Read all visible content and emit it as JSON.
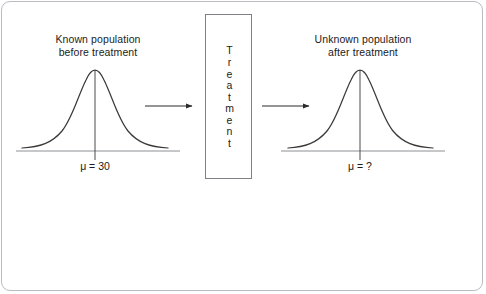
{
  "figure": {
    "kind": "statistics-hypothesis-test-diagram",
    "frame_border_color": "#b9bcc0",
    "background_color": "#ffffff",
    "ink_color": "#1b1b1b",
    "curve_color": "#3a3a3a",
    "axis_color": "#8c8f93"
  },
  "left_panel": {
    "title": "Known population\nbefore treatment",
    "mu_label": "μ = 30",
    "curve": {
      "distribution": "normal",
      "center_x": 95,
      "baseline_y": 151,
      "peak_y": 70,
      "left_tail_x": 22,
      "right_tail_x": 168
    }
  },
  "treatment": {
    "label": "Treatment",
    "letters": [
      "T",
      "r",
      "e",
      "a",
      "t",
      "m",
      "e",
      "n",
      "t"
    ],
    "orientation": "vertical-stacked"
  },
  "right_panel": {
    "title": "Unknown population\nafter treatment",
    "mu_label": "μ = ?",
    "curve": {
      "distribution": "normal",
      "center_x": 360,
      "baseline_y": 151,
      "peak_y": 70,
      "left_tail_x": 288,
      "right_tail_x": 438
    }
  },
  "arrows": [
    {
      "name": "arrow-into-treatment",
      "from_x": 145,
      "to_x": 194,
      "y": 106
    },
    {
      "name": "arrow-out-of-treatment",
      "from_x": 262,
      "to_x": 311,
      "y": 106
    }
  ],
  "chart_data": {
    "type": "line",
    "xlabel": "",
    "ylabel": "",
    "grid": false,
    "legend": "none",
    "series": [
      {
        "name": "Known population before treatment",
        "mean_label": "μ = 30",
        "mean_value": 30,
        "shape": "normal bell curve",
        "x": [
          -3,
          -2.5,
          -2,
          -1.5,
          -1,
          -0.5,
          0,
          0.5,
          1,
          1.5,
          2,
          2.5,
          3
        ],
        "values": [
          0.011,
          0.035,
          0.09,
          0.19,
          0.37,
          0.62,
          0.86,
          0.62,
          0.37,
          0.19,
          0.09,
          0.035,
          0.011
        ]
      },
      {
        "name": "Unknown population after treatment",
        "mean_label": "μ = ?",
        "mean_value": null,
        "shape": "normal bell curve",
        "x": [
          -3,
          -2.5,
          -2,
          -1.5,
          -1,
          -0.5,
          0,
          0.5,
          1,
          1.5,
          2,
          2.5,
          3
        ],
        "values": [
          0.011,
          0.035,
          0.09,
          0.19,
          0.37,
          0.62,
          0.86,
          0.62,
          0.37,
          0.19,
          0.09,
          0.035,
          0.011
        ]
      }
    ],
    "annotations": [
      "Treatment",
      "μ = 30",
      "μ = ?"
    ]
  }
}
